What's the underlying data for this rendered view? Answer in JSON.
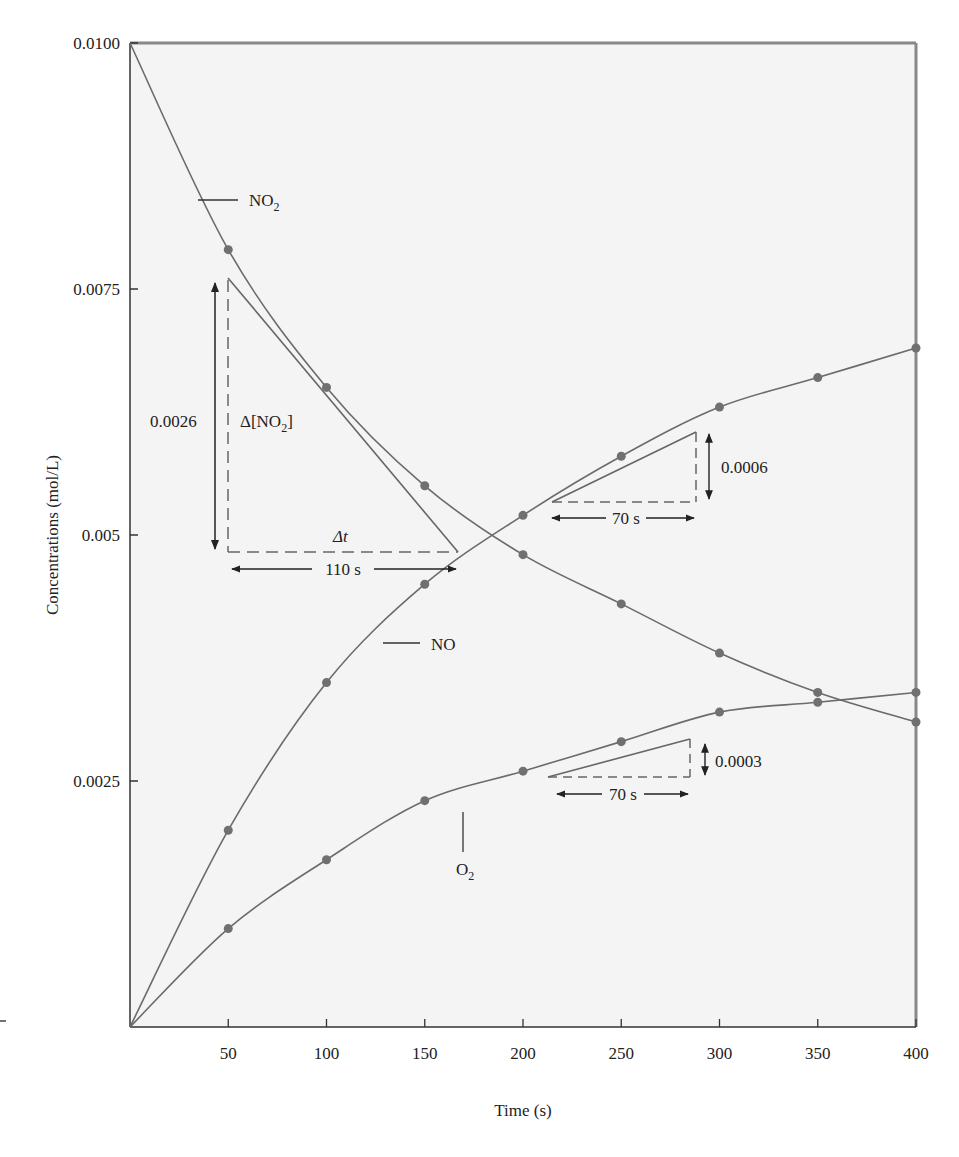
{
  "chart_data": {
    "type": "line",
    "title": "",
    "xlabel": "Time (s)",
    "ylabel": "Concentrations (mol/L)",
    "xlim": [
      0,
      400
    ],
    "ylim": [
      0,
      0.01
    ],
    "x_ticks": [
      50,
      100,
      150,
      200,
      250,
      300,
      350,
      400
    ],
    "x_tick_labels": [
      "50",
      "100",
      "150",
      "200",
      "250",
      "300",
      "350",
      "400"
    ],
    "y_ticks": [
      0.0025,
      0.005,
      0.0075,
      0.01
    ],
    "y_tick_labels": [
      "0.0025",
      "0.005",
      "0.0075",
      "0.0100"
    ],
    "grid": false,
    "x": [
      0,
      50,
      100,
      150,
      200,
      250,
      300,
      350,
      400
    ],
    "series": [
      {
        "name": "NO2",
        "label": "NO",
        "label_sub": "2",
        "values": [
          0.01,
          0.0079,
          0.0065,
          0.0055,
          0.0048,
          0.0043,
          0.0038,
          0.0034,
          0.0031
        ]
      },
      {
        "name": "NO",
        "label": "NO",
        "label_sub": "",
        "values": [
          0,
          0.002,
          0.0035,
          0.0045,
          0.0052,
          0.0058,
          0.0063,
          0.0066,
          0.0069
        ]
      },
      {
        "name": "O2",
        "label": "O",
        "label_sub": "2",
        "values": [
          0,
          0.001,
          0.0017,
          0.0023,
          0.0026,
          0.0029,
          0.0032,
          0.0033,
          0.0034
        ]
      }
    ],
    "annotations": [
      {
        "text": "0.0026",
        "type": "delta-y",
        "series": "NO2"
      },
      {
        "text": "Δ[NO",
        "sub": "2",
        "close": "]",
        "type": "label"
      },
      {
        "text": "Δt",
        "type": "label"
      },
      {
        "text": "110 s",
        "type": "delta-x",
        "series": "NO2"
      },
      {
        "text": "0.0006",
        "type": "delta-y",
        "series": "NO"
      },
      {
        "text": "70 s",
        "type": "delta-x",
        "series": "NO"
      },
      {
        "text": "0.0003",
        "type": "delta-y",
        "series": "O2"
      },
      {
        "text": "70 s",
        "type": "delta-x",
        "series": "O2"
      }
    ],
    "colors": {
      "curve": "#6b6b6b",
      "point": "#707070",
      "background": "#f4f4f4",
      "axis": "#333333"
    }
  }
}
